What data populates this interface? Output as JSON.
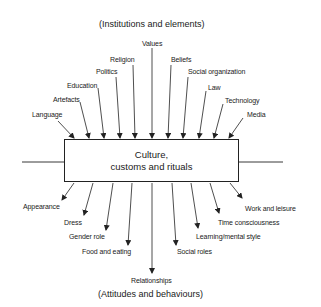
{
  "diagram": {
    "top_heading": "(Institutions and elements)",
    "bottom_heading": "(Attitudes and behaviours)",
    "center": {
      "line1": "Culture,",
      "line2": "customs and rituals"
    },
    "inputs": [
      {
        "label": "Language"
      },
      {
        "label": "Artefacts"
      },
      {
        "label": "Education"
      },
      {
        "label": "Politics"
      },
      {
        "label": "Religion"
      },
      {
        "label": "Values"
      },
      {
        "label": "Beliefs"
      },
      {
        "label": "Social organization"
      },
      {
        "label": "Law"
      },
      {
        "label": "Technology"
      },
      {
        "label": "Media"
      }
    ],
    "outputs": [
      {
        "label": "Appearance"
      },
      {
        "label": "Dress"
      },
      {
        "label": "Gender role"
      },
      {
        "label": "Food and eating"
      },
      {
        "label": "Relationships"
      },
      {
        "label": "Social roles"
      },
      {
        "label": "Learning/mental style"
      },
      {
        "label": "Time consciousness"
      },
      {
        "label": "Work and leisure"
      }
    ],
    "colors": {
      "line": "#222222",
      "text": "#1a1a1a",
      "background": "#ffffff"
    }
  }
}
